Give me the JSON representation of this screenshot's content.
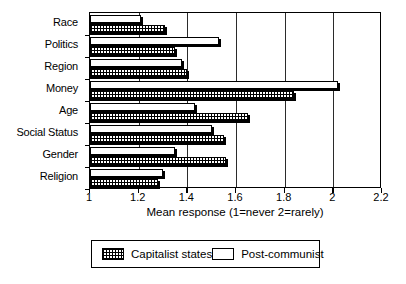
{
  "chart_data": {
    "type": "bar",
    "orientation": "horizontal",
    "title": "",
    "xlabel": "Mean response (1=never 2=rarely)",
    "ylabel": "",
    "xlim": [
      1,
      2.2
    ],
    "xticks": [
      1,
      1.2,
      1.4,
      1.6,
      1.8,
      2,
      2.2
    ],
    "xticklabels": [
      "1",
      "1.2",
      "1.4",
      "1.6",
      "1.8",
      "2",
      "2.2"
    ],
    "grid": "vertical",
    "legend_position": "below-plot",
    "categories": [
      "Race",
      "Politics",
      "Region",
      "Money",
      "Age",
      "Social Status",
      "Gender",
      "Religion"
    ],
    "series": [
      {
        "name": "Post-communist",
        "fill": "white",
        "values": [
          1.21,
          1.53,
          1.38,
          2.02,
          1.43,
          1.5,
          1.35,
          1.3
        ]
      },
      {
        "name": "Capitalist states",
        "fill": "cross-hatch",
        "values": [
          1.31,
          1.35,
          1.4,
          1.84,
          1.65,
          1.55,
          1.56,
          1.28
        ]
      }
    ]
  },
  "legend": {
    "items": [
      {
        "label": "Capitalist states",
        "swatch": "cross-hatch"
      },
      {
        "label": "Post-communist",
        "swatch": "white"
      }
    ]
  },
  "colors": {
    "axis": "#000000",
    "grid": "#2b2b2b",
    "background": "#ffffff",
    "bar_outline": "#000000"
  }
}
